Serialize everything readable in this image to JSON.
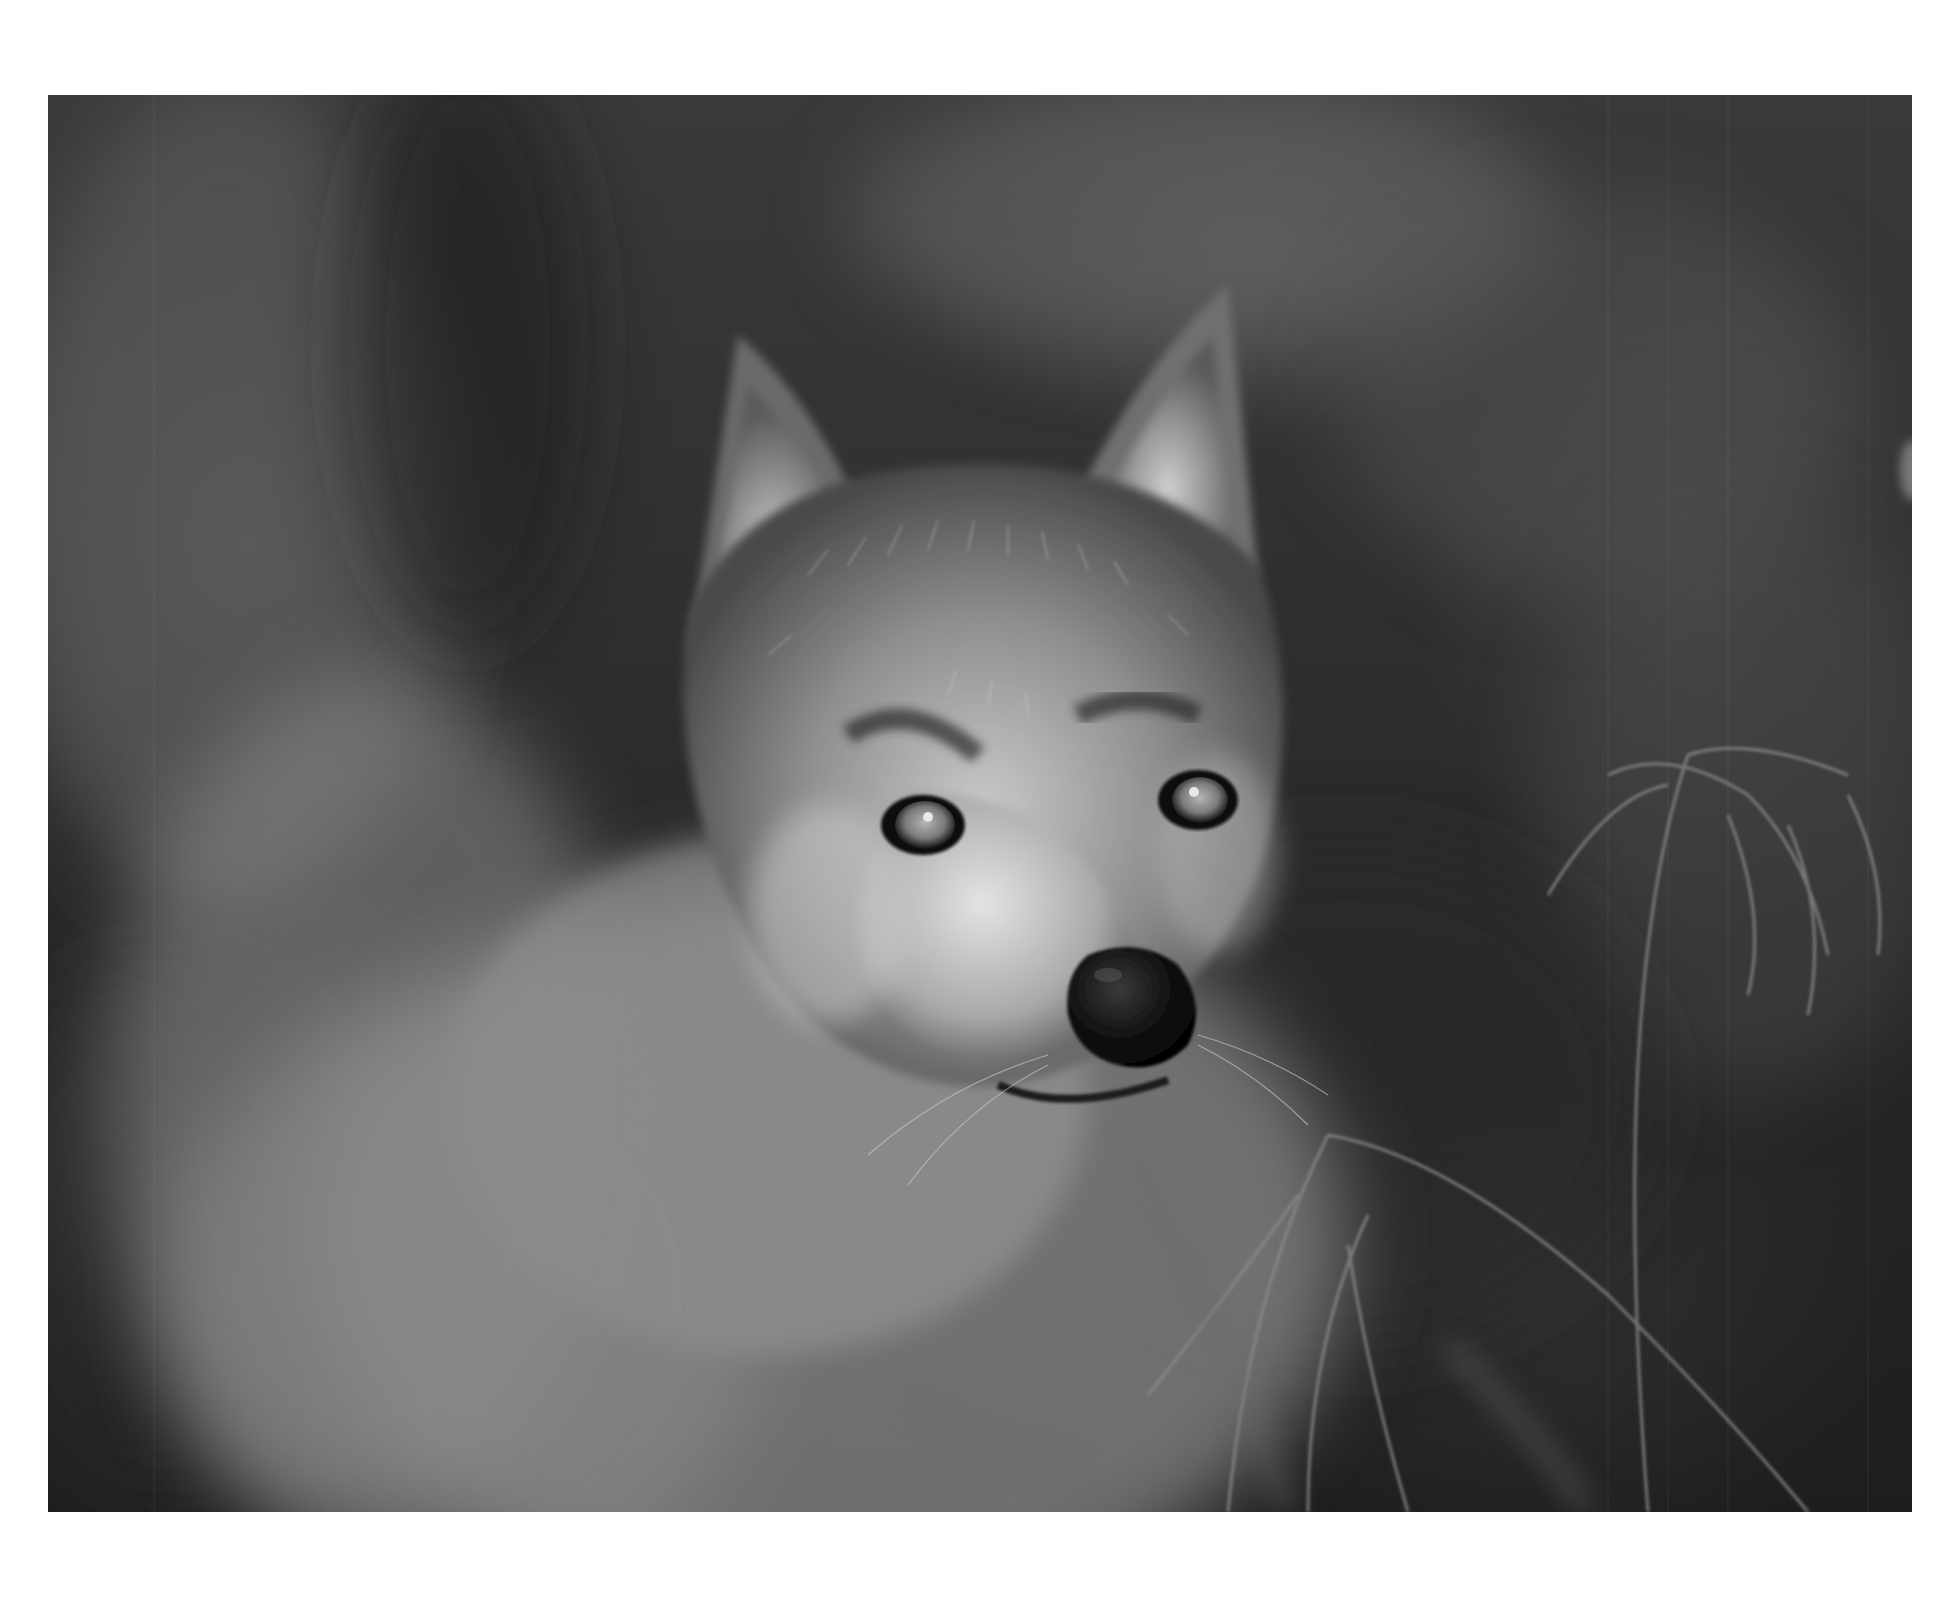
{
  "page": {
    "background": "#ffffff"
  },
  "photo": {
    "subject": "wolf-portrait",
    "style": "black-and-white",
    "tones": {
      "background_dark": "#1e1e1e",
      "background_mid": "#3a3a3a",
      "fur_light": "#d8d8d8",
      "fur_mid": "#8a8a8a",
      "nose": "#0d0d0d",
      "eye": "#9a9a9a"
    }
  }
}
